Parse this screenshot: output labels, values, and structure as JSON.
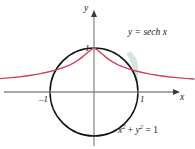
{
  "figure": {
    "kind": "math-plot",
    "background_color": "#ffffff",
    "axes": {
      "x_axis_name": "x",
      "y_axis_name": "y",
      "axis_color": "#8a8a8a",
      "arrow_color": "#3d3d3d",
      "origin_px": [
        94,
        92
      ],
      "unit_px": 44,
      "x_tick_labels": [
        "–1",
        "1"
      ],
      "x_tick_values": [
        -1,
        1
      ],
      "y_tick_labels": [
        "1"
      ],
      "y_tick_values": [
        1
      ]
    },
    "curves": [
      {
        "id": "sech-curve",
        "label": "y = sech x",
        "label_plain": "y = sech x",
        "equation": "y = sech x",
        "color": "#d2405a",
        "stroke_width": 1.4,
        "domain": [
          -2.2,
          2.2
        ]
      },
      {
        "id": "unit-circle",
        "label": "x2 + y2 = 1",
        "label_lhs_x": "x",
        "label_exp_2a": "2",
        "label_plus": " + ",
        "label_lhs_y": "y",
        "label_exp_2b": "2",
        "label_eq": " = 1",
        "equation": "x^2 + y^2 = 1",
        "color": "#141414",
        "stroke_width": 1.5,
        "radius": 1
      }
    ],
    "shaded_region": {
      "id": "sliver-region",
      "description": "region between sech curve and unit circle near x = 1",
      "fill_color": "#cfe0d8",
      "opacity": 0.85
    }
  }
}
